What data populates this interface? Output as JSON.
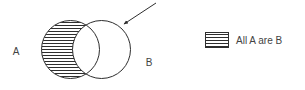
{
  "diagram": {
    "kind": "euler-venn-diagram",
    "sets": [
      {
        "id": "A",
        "label": "A",
        "fill": "hatched-horizontal",
        "label_x": 16,
        "label_y": 52
      },
      {
        "id": "B",
        "label": "B",
        "fill": "none",
        "label_x": 146,
        "label_y": 63
      }
    ],
    "annotation": {
      "name": "pointer-arrow",
      "points_to": "B",
      "tail_x": 156,
      "tail_y": 3,
      "head_x": 121,
      "head_y": 26
    },
    "stroke_color": "#2e2e2e",
    "background_color": "#ffffff"
  },
  "legend": {
    "items": [
      {
        "swatch": "hatched-horizontal-swatch",
        "label": "All A are B"
      }
    ]
  }
}
